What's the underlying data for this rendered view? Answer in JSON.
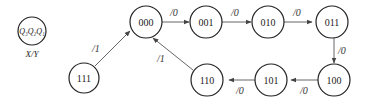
{
  "legend": {
    "state_label": "Q₃Q₂Q₁",
    "io_label": "X/Y"
  },
  "states": [
    {
      "id": "000",
      "label": "000"
    },
    {
      "id": "001",
      "label": "001"
    },
    {
      "id": "010",
      "label": "010"
    },
    {
      "id": "011",
      "label": "011"
    },
    {
      "id": "100",
      "label": "100"
    },
    {
      "id": "101",
      "label": "101"
    },
    {
      "id": "110",
      "label": "110"
    },
    {
      "id": "111",
      "label": "111"
    }
  ],
  "transitions": [
    {
      "from": "000",
      "to": "001",
      "label": "/0"
    },
    {
      "from": "001",
      "to": "010",
      "label": "/0"
    },
    {
      "from": "010",
      "to": "011",
      "label": "/0"
    },
    {
      "from": "011",
      "to": "100",
      "label": "/0"
    },
    {
      "from": "100",
      "to": "101",
      "label": "/0"
    },
    {
      "from": "101",
      "to": "110",
      "label": "/0"
    },
    {
      "from": "110",
      "to": "000",
      "label": "/1"
    },
    {
      "from": "111",
      "to": "000",
      "label": "/1"
    }
  ]
}
